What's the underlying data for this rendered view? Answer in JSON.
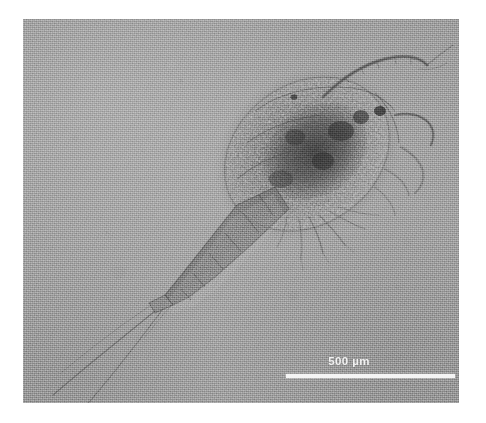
{
  "figure": {
    "kind": "light-micrograph",
    "background_color": "#9b9b9b",
    "frame_background": "#ffffff"
  },
  "micrograph": {
    "x": 23,
    "y": 19,
    "width": 436,
    "height": 384
  },
  "scalebar": {
    "label": "500 µm",
    "value": "500",
    "unit": "µm",
    "color": "#f4f4f4",
    "bar_length_px": 169,
    "bar_thickness_px": 4
  },
  "specimen": {
    "name": "copepod",
    "orientation": "prosome upper-right, urosome and caudal setae lower-left",
    "parts": [
      {
        "name": "prosome",
        "label": "cephalothorax"
      },
      {
        "name": "urosome",
        "label": "abdomen"
      },
      {
        "name": "antennule-left",
        "label": "first antenna"
      },
      {
        "name": "antennule-right",
        "label": "first antenna"
      },
      {
        "name": "caudal-ramus",
        "label": "caudal rami"
      },
      {
        "name": "caudal-seta-1",
        "label": "caudal seta"
      },
      {
        "name": "caudal-seta-2",
        "label": "caudal seta"
      },
      {
        "name": "swimming-legs",
        "label": "thoracic legs"
      },
      {
        "name": "gut-contents",
        "label": "granular gut / egg mass"
      }
    ]
  }
}
